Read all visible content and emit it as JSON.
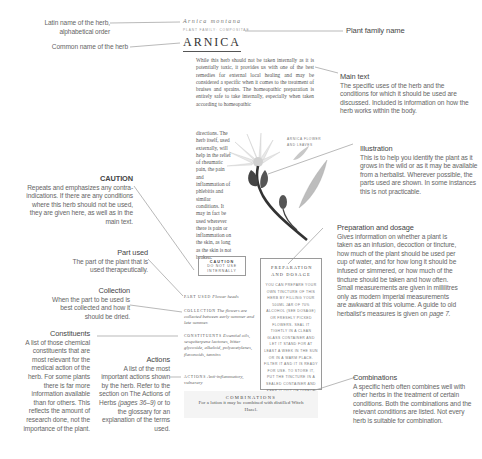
{
  "page": {
    "latin_name": "Arnica montana",
    "family_line": "plant family: Compositae",
    "common_name": "Arnica",
    "main_text_wide": "While this herb should not be taken internally as it is potentially toxic, it provides us with one of the best remedies for external local healing and may be considered a specific when it comes to the treatment of bruises and sprains. The homeopathic preparation is entirely safe to take internally, especially when taken according to homeopathic",
    "main_text_narrow": "directions. The herb itself, used externally, will help in the relief of rheumatic pain, the pain and inflammation of phlebitis and similar conditions. It may in fact be used wherever there is pain or inflammation on the skin, as long as the skin is not broken.",
    "illustration_caption": "Arnica flower and leaves",
    "caution": {
      "title": "Caution",
      "text": "Do not use internally"
    },
    "part_used": {
      "label": "Part used",
      "text": "Flower heads"
    },
    "collection": {
      "label": "Collection",
      "text": "The flowers are collected between early summer and late summer."
    },
    "constituents": {
      "label": "Constituents",
      "text": "Essential oils, sesquiterpene lactones, bitter glycoside, alkaloid, polyacetylenes, flavonoids, tannins"
    },
    "actions": {
      "label": "Actions",
      "text": "Anti-inflammatory, vulnerary"
    },
    "preparation": {
      "title": "Preparation and Dosage",
      "text": "You can prepare your own tincture of this herb by filling your 500ml jar of 70% alcohol (see Dosage) or freshly picked flowers. Seal it tightly in a clean glass container and let it stand for at least a week in the sun or in a warm place. Filter it and it is ready for use. To store it, put the tincture in a sealed container and keep it out of direct sunlight."
    },
    "combinations": {
      "title": "Combinations",
      "text": "For a lotion it may be combined with distilled Witch Hazel."
    }
  },
  "annotations": {
    "latin": "Latin name of the herb, alphabetical order",
    "common": "Common name of the herb",
    "family": "Plant family name",
    "main_text": {
      "title": "Main text",
      "body": "The specific uses of the herb and the conditions for which it should be used are discussed. Included is information on how the herb works within the body."
    },
    "illustration": {
      "title": "Illustration",
      "body": "This is to help you identify the plant as it grows in the wild or as it may be available from a herbalist. Wherever possible, the parts used are shown. In some instances this is not practicable."
    },
    "caution": {
      "title": "CAUTION",
      "body": "Repeats and emphasizes any contra-indications. If there are any conditions where this herb should not be used, they are given here, as well as in the main text."
    },
    "part_used": {
      "title": "Part used",
      "body": "The part of the plant that is used therapeutically."
    },
    "collection": {
      "title": "Collection",
      "body": "When the part to be used is best collected and how it should be dried."
    },
    "preparation": {
      "title": "Preparation and dosage",
      "body": "Gives information on whether a plant is taken as an infusion, decoction or tincture, how much of the plant should be used per cup of water, and for how long it should be infused or simmered, or how much of the tincture should be taken and how often. Small measurements are given in millilitres only as modern imperial measurements are awkward at this volume. A guide to old herbalist's measures is given on ",
      "page_ref": "page 7."
    },
    "constituents": {
      "title": "Constituents",
      "body": "A list of those chemical constituents that are most relevant for the medical action of the herb. For some plants there is far more information available than for others. This reflects the amount of research done, not the importance of the plant."
    },
    "actions": {
      "title": "Actions",
      "body_pre": "A list of the most important actions shown by the herb. Refer to the section on The Actions of Herbs ",
      "page_ref": "(pages 36–9)",
      "body_post": " or to the glossary for an explanation of the terms used."
    },
    "combinations": {
      "title": "Combinations",
      "body": "A specific herb often combines well with other herbs in the treatment of certain conditions. Both the combinations and the relevant conditions are listed. Not every herb is suitable for combination."
    }
  },
  "colors": {
    "text": "#444444",
    "annotation": "#666666",
    "leader_line": "#8a8a8a",
    "box_border": "#9a9a9a",
    "combo_bg": "#f4f4f4"
  }
}
